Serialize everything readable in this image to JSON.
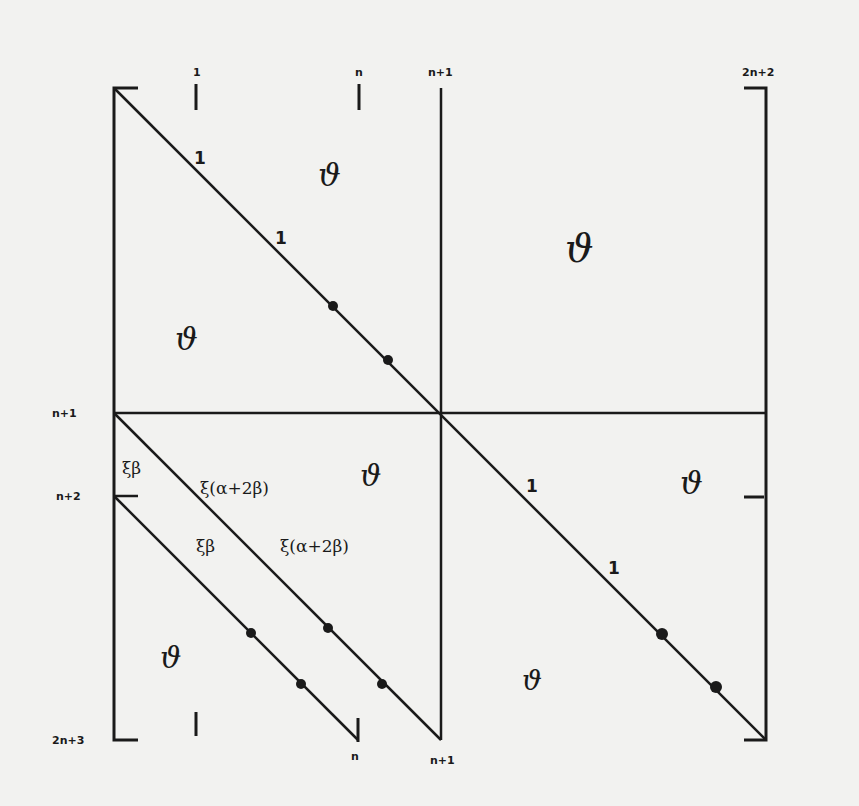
{
  "diagram": {
    "column_labels": {
      "col_1": "1",
      "col_n": "n",
      "col_n1": "n+1",
      "col_2n2": "2n+2",
      "bottom_n": "n",
      "bottom_n1": "n+1"
    },
    "row_labels": {
      "row_n1": "n+1",
      "row_n2": "n+2",
      "row_2n3": "2n+3"
    },
    "blocks": {
      "top_left": {
        "zero_upper": "ϑ",
        "zero_lower": "ϑ",
        "diag_label_1": "1",
        "diag_label_2": "1"
      },
      "top_right": {
        "zero": "ϑ"
      },
      "bottom_left": {
        "coef_beta_1": "ξβ",
        "coef_alpha_1": "ξ(α+2β)",
        "coef_beta_2": "ξβ",
        "coef_alpha_2": "ξ(α+2β)",
        "zero_center": "ϑ",
        "zero_lower": "ϑ"
      },
      "bottom_right": {
        "diag_label_1": "1",
        "diag_label_2": "1",
        "zero_upper": "ϑ",
        "zero_lower": "ϑ"
      }
    },
    "colors": {
      "ink": "#1a1a1a",
      "paper": "#f2f2f0"
    }
  }
}
